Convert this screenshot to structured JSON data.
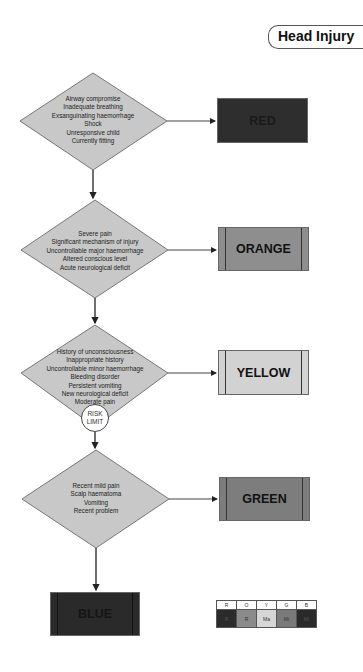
{
  "title": "Head Injury",
  "colors": {
    "diamond_fill": "#c8c8c8",
    "red": "#2e2e2e",
    "orange": "#8e8e8e",
    "yellow": "#d2d2d2",
    "green": "#7d7d7d",
    "blue": "#2a2a2a"
  },
  "diamonds": [
    {
      "lines": [
        "Airway compromise",
        "Inadequate breathing",
        "Exsanguinating haemorrhage",
        "Shock",
        "Unresponsive child",
        "Currently fitting"
      ]
    },
    {
      "lines": [
        "Severe pain",
        "Significant mechanism of injury",
        "Uncontrollable major haemorrhage",
        "Altered conscious level",
        "Acute neurological deficit"
      ]
    },
    {
      "lines": [
        "History of unconsciousness",
        "Inappropriate history",
        "Uncontrollable minor haemorrhage",
        "Bleeding disorder",
        "Persistent vomiting",
        "New neurological deficit",
        "Moderate pain"
      ]
    },
    {
      "lines": [
        "Recent mild pain",
        "Scalp haematoma",
        "Vomiting",
        "Recent problem"
      ]
    }
  ],
  "outcomes": {
    "red": "RED",
    "orange": "ORANGE",
    "yellow": "YELLOW",
    "green": "GREEN",
    "blue": "BLUE"
  },
  "risk_limit": {
    "line1": "RISK",
    "line2": "LIMIT"
  },
  "legend": {
    "headers": [
      "R",
      "O",
      "Y",
      "G",
      "B"
    ],
    "values": [
      "R",
      "R",
      "Ma",
      "Mi",
      "Mi"
    ],
    "fills": [
      "#2b2b2b",
      "#8a8a8a",
      "#d6d6d6",
      "#7a7a7a",
      "#2a2a2a"
    ],
    "text_colors": [
      "#555",
      "#333",
      "#333",
      "#333",
      "#555"
    ]
  }
}
